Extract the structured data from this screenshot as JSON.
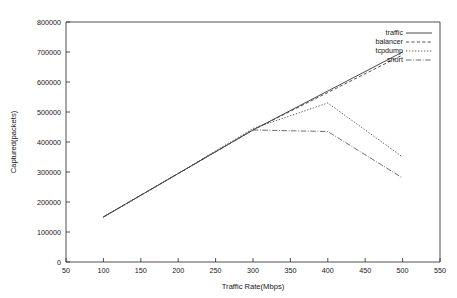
{
  "chart_data": {
    "type": "line",
    "title": "",
    "xlabel": "Traffic Rate(Mbps)",
    "ylabel": "Captured(packets)",
    "xlim": [
      50,
      550
    ],
    "ylim": [
      0,
      800000
    ],
    "xticks": [
      50,
      100,
      150,
      200,
      250,
      300,
      350,
      400,
      450,
      500,
      550
    ],
    "yticks": [
      0,
      100000,
      200000,
      300000,
      400000,
      500000,
      600000,
      700000,
      800000
    ],
    "grid": false,
    "legend_position": "top-right",
    "x": [
      100,
      200,
      300,
      400,
      500
    ],
    "series": [
      {
        "name": "traffic",
        "style": "solid",
        "values": [
          150000,
          295000,
          440000,
          570000,
          700000
        ]
      },
      {
        "name": "balancer",
        "style": "dashed",
        "values": [
          150000,
          295000,
          440000,
          565000,
          690000
        ]
      },
      {
        "name": "tcpdump",
        "style": "dotted",
        "values": [
          150000,
          295000,
          445000,
          530000,
          350000
        ]
      },
      {
        "name": "snort",
        "style": "dash-dot",
        "values": [
          150000,
          295000,
          440000,
          435000,
          280000
        ]
      }
    ]
  },
  "axes": {
    "x_tick_labels": [
      "50",
      "100",
      "150",
      "200",
      "250",
      "300",
      "350",
      "400",
      "450",
      "500",
      "550"
    ],
    "y_tick_labels": [
      "0",
      "100000",
      "200000",
      "300000",
      "400000",
      "500000",
      "600000",
      "700000",
      "800000"
    ],
    "x_axis_title": "Traffic Rate(Mbps)",
    "y_axis_title": "Captured(packets)"
  },
  "legend": {
    "items": [
      {
        "label": "traffic"
      },
      {
        "label": "balancer"
      },
      {
        "label": "tcpdump"
      },
      {
        "label": "snort"
      }
    ]
  }
}
